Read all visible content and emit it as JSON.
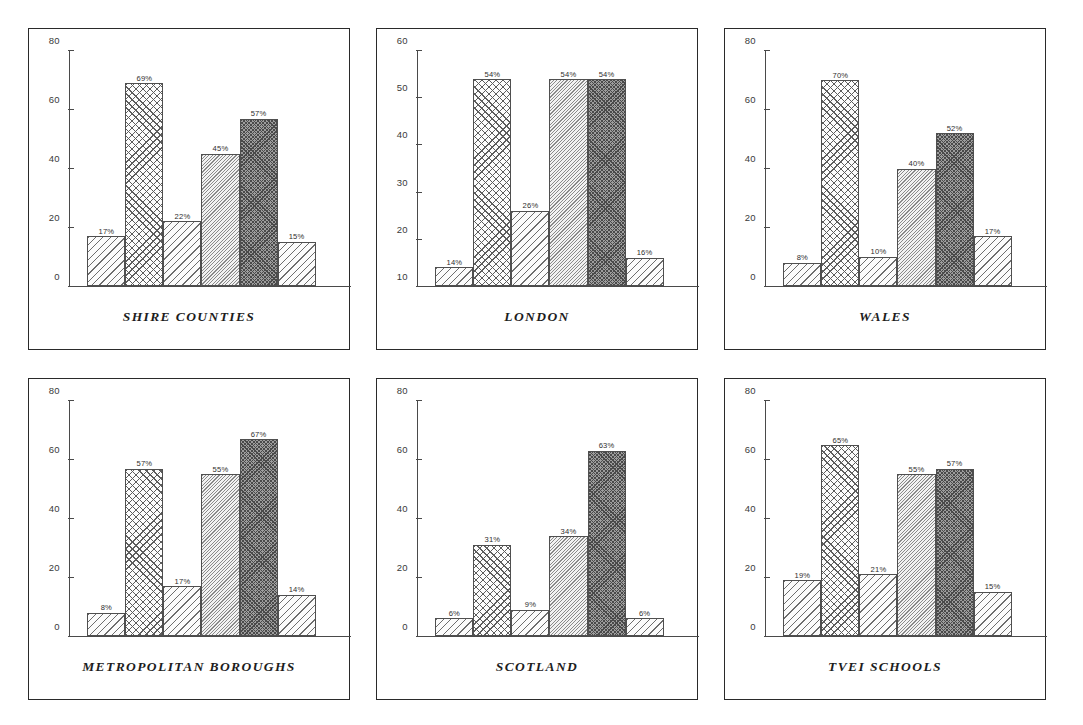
{
  "figure": {
    "layout": "3 columns x 2 rows of bar-chart panels",
    "panel_count": 6
  },
  "chart_data": [
    {
      "type": "bar",
      "title": "SHIRE COUNTIES",
      "categories": [
        "1",
        "2",
        "3",
        "4",
        "5",
        "6"
      ],
      "values": [
        17,
        69,
        22,
        45,
        57,
        15
      ],
      "data_labels": [
        "17%",
        "69%",
        "22%",
        "45%",
        "57%",
        "15%"
      ],
      "patterns": [
        "diagonal",
        "crosshatch-diamond",
        "diagonal",
        "fine-diagonal",
        "dark-crosshatch",
        "diagonal"
      ],
      "xlabel": "",
      "ylabel": "",
      "ylim": [
        0,
        80
      ],
      "yticks": [
        0,
        20,
        40,
        60,
        80
      ],
      "ytick_labels": [
        "0",
        "20",
        "40",
        "60",
        "80"
      ],
      "grid": false,
      "legend": "none"
    },
    {
      "type": "bar",
      "title": "LONDON",
      "categories": [
        "1",
        "2",
        "3",
        "4",
        "5",
        "6"
      ],
      "values": [
        14,
        54,
        26,
        54,
        54,
        16
      ],
      "data_labels": [
        "14%",
        "54%",
        "26%",
        "54%",
        "54%",
        "16%"
      ],
      "patterns": [
        "diagonal",
        "crosshatch-diamond",
        "diagonal",
        "fine-diagonal",
        "dark-crosshatch",
        "diagonal"
      ],
      "xlabel": "",
      "ylabel": "",
      "ylim": [
        10,
        60
      ],
      "yticks": [
        10,
        20,
        30,
        40,
        50,
        60
      ],
      "ytick_labels": [
        "10",
        "20",
        "30",
        "40",
        "50",
        "60"
      ],
      "grid": false,
      "legend": "none"
    },
    {
      "type": "bar",
      "title": "WALES",
      "categories": [
        "1",
        "2",
        "3",
        "4",
        "5",
        "6"
      ],
      "values": [
        8,
        70,
        10,
        40,
        52,
        17
      ],
      "data_labels": [
        "8%",
        "70%",
        "10%",
        "40%",
        "52%",
        "17%"
      ],
      "patterns": [
        "diagonal",
        "crosshatch-diamond",
        "diagonal",
        "fine-diagonal",
        "dark-crosshatch",
        "diagonal"
      ],
      "xlabel": "",
      "ylabel": "",
      "ylim": [
        0,
        80
      ],
      "yticks": [
        0,
        20,
        40,
        60,
        80
      ],
      "ytick_labels": [
        "0",
        "20",
        "40",
        "60",
        "80"
      ],
      "grid": false,
      "legend": "none"
    },
    {
      "type": "bar",
      "title": "METROPOLITAN BOROUGHS",
      "categories": [
        "1",
        "2",
        "3",
        "4",
        "5",
        "6"
      ],
      "values": [
        8,
        57,
        17,
        55,
        67,
        14
      ],
      "data_labels": [
        "8%",
        "57%",
        "17%",
        "55%",
        "67%",
        "14%"
      ],
      "patterns": [
        "diagonal",
        "crosshatch-diamond",
        "diagonal",
        "fine-diagonal",
        "dark-crosshatch",
        "diagonal"
      ],
      "xlabel": "",
      "ylabel": "",
      "ylim": [
        0,
        80
      ],
      "yticks": [
        0,
        20,
        40,
        60,
        80
      ],
      "ytick_labels": [
        "0",
        "20",
        "40",
        "60",
        "80"
      ],
      "grid": false,
      "legend": "none"
    },
    {
      "type": "bar",
      "title": "SCOTLAND",
      "categories": [
        "1",
        "2",
        "3",
        "4",
        "5",
        "6"
      ],
      "values": [
        6,
        31,
        9,
        34,
        63,
        6
      ],
      "data_labels": [
        "6%",
        "31%",
        "9%",
        "34%",
        "63%",
        "6%"
      ],
      "patterns": [
        "diagonal",
        "crosshatch-diamond",
        "diagonal",
        "fine-diagonal",
        "dark-crosshatch",
        "diagonal"
      ],
      "xlabel": "",
      "ylabel": "",
      "ylim": [
        0,
        80
      ],
      "yticks": [
        0,
        20,
        40,
        60,
        80
      ],
      "ytick_labels": [
        "0",
        "20",
        "40",
        "60",
        "80"
      ],
      "grid": false,
      "legend": "none"
    },
    {
      "type": "bar",
      "title": "TVEI SCHOOLS",
      "categories": [
        "1",
        "2",
        "3",
        "4",
        "5",
        "6"
      ],
      "values": [
        19,
        65,
        21,
        55,
        57,
        15
      ],
      "data_labels": [
        "19%",
        "65%",
        "21%",
        "55%",
        "57%",
        "15%"
      ],
      "patterns": [
        "diagonal",
        "crosshatch-diamond",
        "diagonal",
        "fine-diagonal",
        "dark-crosshatch",
        "diagonal"
      ],
      "xlabel": "",
      "ylabel": "",
      "ylim": [
        0,
        80
      ],
      "yticks": [
        0,
        20,
        40,
        60,
        80
      ],
      "ytick_labels": [
        "0",
        "20",
        "40",
        "60",
        "80"
      ],
      "grid": false,
      "legend": "none"
    }
  ]
}
